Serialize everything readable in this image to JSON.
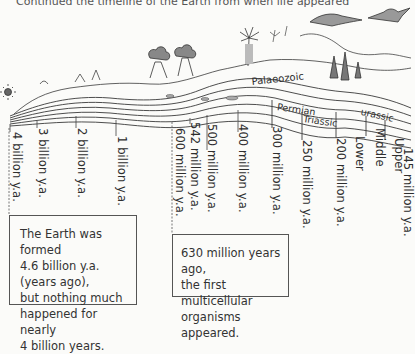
{
  "header": {
    "partial_text": "Continued the timeline of the Earth from when life appeared"
  },
  "timeline": {
    "ticks": [
      {
        "label": "4 billion y.a.",
        "x": 10
      },
      {
        "label": "3 billion y.a.",
        "x": 37
      },
      {
        "label": "2 billion y.a.",
        "x": 76
      },
      {
        "label": "1 billion y.a.",
        "x": 116
      },
      {
        "label": "600 million y.a.",
        "x": 173
      },
      {
        "label": "542 million y.a.",
        "x": 190
      },
      {
        "label": "500 million y.a.",
        "x": 207
      },
      {
        "label": "400 million y.a.",
        "x": 238
      },
      {
        "label": "300 million y.a.",
        "x": 272
      },
      {
        "label": "250 million y.a.",
        "x": 302
      },
      {
        "label": "200 million y.a.",
        "x": 336
      },
      {
        "label": "Lower",
        "x": 355
      },
      {
        "label": "Middle",
        "x": 375
      },
      {
        "label": "Upper",
        "x": 394
      },
      {
        "label": "145 million y.a.",
        "x": 403
      }
    ],
    "eras": [
      {
        "label": "Palaeozoic"
      },
      {
        "label": "Permian"
      },
      {
        "label": "Triassic"
      },
      {
        "label": "Jurassic",
        "visible_text": "urassic"
      }
    ]
  },
  "notes": [
    {
      "lines": [
        "The Earth was formed",
        "4.6 billion y.a. (years ago),",
        "but nothing much",
        "happened for nearly",
        "4 billion years."
      ]
    },
    {
      "lines": [
        "630 million years ago,",
        "the first multicellular",
        "organisms appeared."
      ]
    }
  ],
  "colors": {
    "ink": "#333333",
    "paper": "#fbfbf9"
  }
}
